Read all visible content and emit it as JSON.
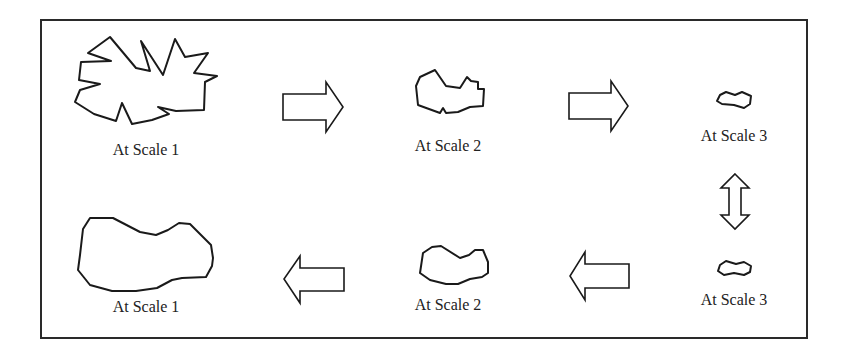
{
  "diagram": {
    "frame": {
      "x": 41,
      "y": 20,
      "width": 766,
      "height": 318
    },
    "colors": {
      "stroke": "#1a1a1a",
      "background": "#ffffff",
      "text": "#222222"
    },
    "top_row": [
      {
        "label": "At Scale 1",
        "label_pos": {
          "x": 146,
          "y": 142
        },
        "points": "88,53 110,37 136,68 150,71 141,41 163,75 175,39 185,57 208,53 194,73 217,76 205,82 204,110 176,111 158,107 169,114 152,120 132,124 122,103 116,121 94,114 75,102 80,90 100,84 79,80 81,62 111,61"
      },
      {
        "label": "At Scale 2",
        "label_pos": {
          "x": 448,
          "y": 138
        },
        "points": "416,86 420,77 435,70 446,86 460,88 467,77 471,81 478,82 478,89 484,89 483,106 470,107 458,112 446,113 443,108 440,113 418,105"
      },
      {
        "label": "At Scale 3",
        "label_pos": {
          "x": 734,
          "y": 128
        },
        "points": "720,95 726,92 735,95 742,92 751,96 750,104 744,108 734,105 722,104 717,101"
      }
    ],
    "bottom_row": [
      {
        "label": "At Scale 1",
        "label_pos": {
          "x": 146,
          "y": 299
        },
        "points": "90,218 113,218 140,232 156,235 168,230 179,223 190,224 211,245 213,258 212,266 206,277 182,278 172,280 157,288 136,291 112,291 90,285 78,270 80,255 83,229"
      },
      {
        "label": "At Scale 2",
        "label_pos": {
          "x": 448,
          "y": 297
        },
        "points": "423,253 432,247 441,246 460,258 469,255 475,250 483,250 488,262 488,273 482,277 470,279 458,284 446,284 430,280 420,273"
      },
      {
        "label": "At Scale 3",
        "label_pos": {
          "x": 734,
          "y": 292
        },
        "points": "720,265 726,261 736,264 744,262 751,266 750,272 744,275 734,273 724,275 718,271"
      }
    ],
    "arrows": [
      {
        "name": "arrow-right-1",
        "direction": "right",
        "points": "283,94 326,94 326,82 343,107 326,132 326,120 283,120"
      },
      {
        "name": "arrow-right-2",
        "direction": "right",
        "points": "569,93 611,93 611,81 628,106 611,131 611,119 569,119"
      },
      {
        "name": "arrow-updown",
        "direction": "up-down",
        "points": "735,174 749,188 741,188 741,215 749,215 735,229 721,215 729,215 729,188 721,188"
      },
      {
        "name": "arrow-left-1",
        "direction": "left",
        "points": "344,268 300,268 300,256 284,279 300,303 300,291 344,291"
      },
      {
        "name": "arrow-left-2",
        "direction": "left",
        "points": "629,264 585,264 585,252 570,276 585,300 585,288 629,288"
      }
    ]
  }
}
